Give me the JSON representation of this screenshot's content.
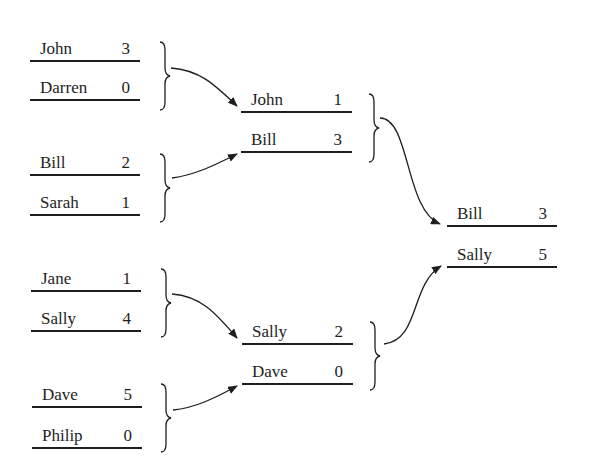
{
  "rounds": [
    {
      "name": "round-1",
      "matches": [
        {
          "players": [
            {
              "name": "John",
              "score": "3"
            },
            {
              "name": "Darren",
              "score": "0"
            }
          ]
        },
        {
          "players": [
            {
              "name": "Bill",
              "score": "2"
            },
            {
              "name": "Sarah",
              "score": "1"
            }
          ]
        },
        {
          "players": [
            {
              "name": "Jane",
              "score": "1"
            },
            {
              "name": "Sally",
              "score": "4"
            }
          ]
        },
        {
          "players": [
            {
              "name": "Dave",
              "score": "5"
            },
            {
              "name": "Philip",
              "score": "0"
            }
          ]
        }
      ]
    },
    {
      "name": "round-2",
      "matches": [
        {
          "players": [
            {
              "name": "John",
              "score": "1"
            },
            {
              "name": "Bill",
              "score": "3"
            }
          ]
        },
        {
          "players": [
            {
              "name": "Sally",
              "score": "2"
            },
            {
              "name": "Dave",
              "score": "0"
            }
          ]
        }
      ]
    },
    {
      "name": "final",
      "matches": [
        {
          "players": [
            {
              "name": "Bill",
              "score": "3"
            },
            {
              "name": "Sally",
              "score": "5"
            }
          ]
        }
      ]
    }
  ],
  "colors": {
    "ink": "#1e1e1e",
    "background": "#ffffff"
  }
}
